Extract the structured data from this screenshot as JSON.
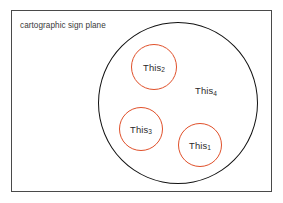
{
  "canvas": {
    "width": 283,
    "height": 203,
    "background": "#ffffff"
  },
  "plane": {
    "label": "cartographic sign plane",
    "border_color": "#4a4a4a",
    "text_color": "#3a3a3a"
  },
  "outer_circle": {
    "name": "sign-system-circle",
    "stroke": "#111111",
    "cx": 178,
    "cy": 103,
    "rx": 80,
    "ry": 81
  },
  "sign_circles": [
    {
      "id": "this2",
      "label_base": "This",
      "label_sub": "2",
      "stroke": "#e0502a",
      "cx": 154,
      "cy": 67,
      "r": 23
    },
    {
      "id": "this3",
      "label_base": "This",
      "label_sub": "3",
      "stroke": "#e0502a",
      "cx": 141,
      "cy": 129,
      "r": 22
    },
    {
      "id": "this1",
      "label_base": "This",
      "label_sub": "1",
      "stroke": "#e0502a",
      "cx": 200,
      "cy": 145,
      "r": 22
    }
  ],
  "free_labels": [
    {
      "id": "this4",
      "label_base": "This",
      "label_sub": "4",
      "cx": 206,
      "cy": 90
    }
  ],
  "colors": {
    "accent_red": "#e0502a",
    "outline_black": "#111111",
    "frame_gray": "#4a4a4a",
    "text_gray": "#2b2b2b"
  }
}
